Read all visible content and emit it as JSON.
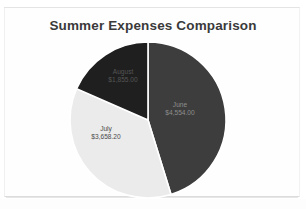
{
  "document": {
    "type": "scanned-slide",
    "background_color": "#ffffff",
    "paper_color": "#fefefe"
  },
  "chart_data": {
    "type": "pie",
    "title": "Summer Expenses Comparison",
    "categories": [
      "June",
      "July",
      "August"
    ],
    "values": [
      4554.0,
      3658.2,
      1855.0
    ],
    "value_labels": [
      "$4,554.00",
      "$3,658.20",
      "$1,855.00"
    ],
    "colors": [
      "#3d3d3d",
      "#ebebeb",
      "#1f1f1f"
    ],
    "start_angle_deg": 0,
    "direction": "clockwise",
    "legend": "none",
    "data_labels": true,
    "slices": [
      {
        "name": "June",
        "value": 4554.0,
        "value_label": "$4,554.00",
        "color": "#3d3d3d",
        "percent": 45.2,
        "label_color": "#8e8e8e"
      },
      {
        "name": "July",
        "value": 3658.2,
        "value_label": "$3,658.20",
        "color": "#ebebeb",
        "percent": 36.3,
        "label_color": "#4a4a4a"
      },
      {
        "name": "August",
        "value": 1855.0,
        "value_label": "$1,855.00",
        "color": "#1f1f1f",
        "percent": 18.4,
        "label_color": "#555555"
      }
    ]
  }
}
